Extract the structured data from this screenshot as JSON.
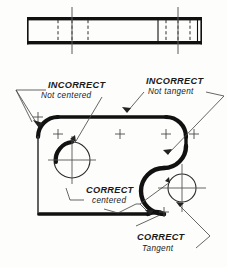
{
  "drawing": {
    "title": "Tangent and Centered Arc Construction",
    "sheet_bg": "#fdfdfb",
    "line_color": "#111111",
    "thin_line_color": "#3a3a3a",
    "center_line_color": "#555555"
  },
  "top_view": {
    "name": "edge-view-bar",
    "x": 27,
    "y": 17,
    "width": 175,
    "height": 27,
    "description": "Thin rectangular edge view of the plate with hidden lines and center lines",
    "hidden_lines_left": [
      58,
      72,
      88
    ],
    "hidden_lines_right": [
      165,
      178,
      190
    ],
    "solid_dividers_right": [
      158,
      198
    ],
    "center_lines": [
      72,
      178
    ],
    "center_line_overhang": 10
  },
  "front_view": {
    "name": "front-view-outline",
    "outline_description": "Plate outline with rounded top-left corner, rounded top-right corner, reverse S-curve at right, circular boss at lower right, and square lower-left corner",
    "left_edge_x": 38,
    "top_edge_y": 117,
    "bottom_edge_y": 215,
    "right_extent_x": 212,
    "corner_radius_top_left": 20,
    "corner_radius_top_right": 20
  },
  "features": [
    {
      "name": "hole-not-centered",
      "type": "circle",
      "cx": 72,
      "cy": 160,
      "r": 18,
      "note": "INCORRECT - arc not centered on hole"
    },
    {
      "name": "boss-hole-tangent",
      "type": "circle",
      "cx": 182,
      "cy": 188,
      "r": 14,
      "note": "CORRECT - tangent reverse curve"
    }
  ],
  "center_marks": [
    {
      "name": "center-mark-tl",
      "cx": 58,
      "cy": 134
    },
    {
      "name": "center-mark-tm",
      "cx": 120,
      "cy": 134
    },
    {
      "name": "center-mark-tr",
      "cx": 166,
      "cy": 134
    },
    {
      "name": "center-mark-far-right",
      "cx": 194,
      "cy": 134
    },
    {
      "name": "center-mark-boss-low",
      "cx": 164,
      "cy": 212
    }
  ],
  "labels": {
    "incorrect_not_centered": {
      "name": "label-incorrect-not-centered",
      "line1": "INCORRECT",
      "line2": "Not  centered",
      "x1": 48,
      "y1": 88,
      "x2": 41,
      "y2": 98
    },
    "incorrect_not_tangent": {
      "name": "label-incorrect-not-tangent",
      "line1": "INCORRECT",
      "line2": "Not tangent",
      "x1": 146,
      "y1": 84,
      "x2": 148,
      "y2": 94
    },
    "correct_centered": {
      "name": "label-correct-centered",
      "line1": "CORRECT",
      "line2": "centered",
      "x1": 86,
      "y1": 193,
      "x2": 92,
      "y2": 203
    },
    "correct_tangent": {
      "name": "label-correct-tangent",
      "line1": "CORRECT",
      "line2": "Tangent",
      "x1": 137,
      "y1": 240,
      "x2": 142,
      "y2": 251
    }
  },
  "leaders": [
    {
      "name": "leader-not-centered-left",
      "target": "top-left-corner-arc"
    },
    {
      "name": "leader-not-centered-hole",
      "target": "hole-not-centered"
    },
    {
      "name": "leader-not-tangent-top",
      "target": "top-right-tangent-point"
    },
    {
      "name": "leader-not-tangent-right",
      "target": "reverse-curve-upper"
    },
    {
      "name": "leader-correct-centered-a",
      "target": "boss-hole-tangent"
    },
    {
      "name": "leader-correct-centered-b",
      "target": "bottom-left-corner"
    },
    {
      "name": "leader-correct-tangent",
      "target": "reverse-curve-lower"
    }
  ]
}
